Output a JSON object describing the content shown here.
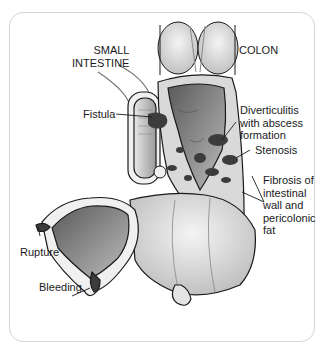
{
  "figure": {
    "labels": {
      "small_intestine": "SMALL\nINTESTINE",
      "colon": "COLON",
      "fistula": "Fistula",
      "diverticulitis": "Diverticulitis\nwith abscess\nformation",
      "stenosis": "Stenosis",
      "fibrosis": "Fibrosis of\nintestinal\nwall and\npericolonic\nfat",
      "rupture": "Rupture",
      "bleeding": "Bleeding"
    },
    "colors": {
      "frame": "#d4d4d4",
      "tissue_light": "#e2e2e2",
      "tissue_mid": "#a8a8a8",
      "lumen_dark": "#6e6e6e",
      "abscess": "#3c3c3c",
      "outline": "#1a1a1a"
    }
  }
}
